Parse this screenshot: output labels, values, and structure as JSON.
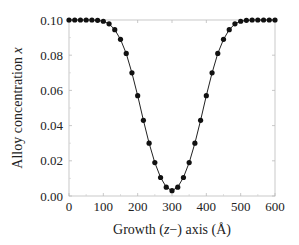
{
  "chart_data": {
    "type": "line",
    "title": "",
    "xlabel": "Growth (z−) axis (Å)",
    "ylabel": "Alloy concentration x",
    "xlim": [
      0,
      600
    ],
    "ylim": [
      0.0,
      0.1
    ],
    "x_ticks": [
      "0",
      "100",
      "200",
      "300",
      "400",
      "500",
      "600"
    ],
    "y_ticks": [
      "0.00",
      "0.02",
      "0.04",
      "0.06",
      "0.08",
      "0.10"
    ],
    "grid": false,
    "legend": null,
    "series": [
      {
        "name": "Alloy concentration profile",
        "marker": "filled-circle",
        "line": "solid",
        "x": [
          0,
          16.7,
          33.3,
          50,
          66.7,
          83.3,
          100,
          116.7,
          133.3,
          150,
          166.7,
          183.3,
          200,
          216.7,
          233.3,
          250,
          266.7,
          283.3,
          300,
          316.7,
          333.3,
          350,
          366.7,
          383.3,
          400,
          416.7,
          433.3,
          450,
          466.7,
          483.3,
          500,
          516.7,
          533.3,
          550,
          566.7,
          583.3,
          600
        ],
        "values": [
          0.1,
          0.1,
          0.1,
          0.1,
          0.1,
          0.0998,
          0.0993,
          0.0978,
          0.0945,
          0.089,
          0.081,
          0.07,
          0.057,
          0.043,
          0.03,
          0.019,
          0.0105,
          0.005,
          0.003,
          0.005,
          0.0105,
          0.019,
          0.03,
          0.043,
          0.057,
          0.07,
          0.081,
          0.089,
          0.0945,
          0.0978,
          0.0993,
          0.0998,
          0.1,
          0.1,
          0.1,
          0.1,
          0.1
        ]
      }
    ]
  },
  "labels": {
    "xlabel_pre": "Growth (",
    "xlabel_var": "z",
    "xlabel_post": "−) axis (Å)",
    "ylabel_pre": "Alloy concentration ",
    "ylabel_var": "x"
  }
}
